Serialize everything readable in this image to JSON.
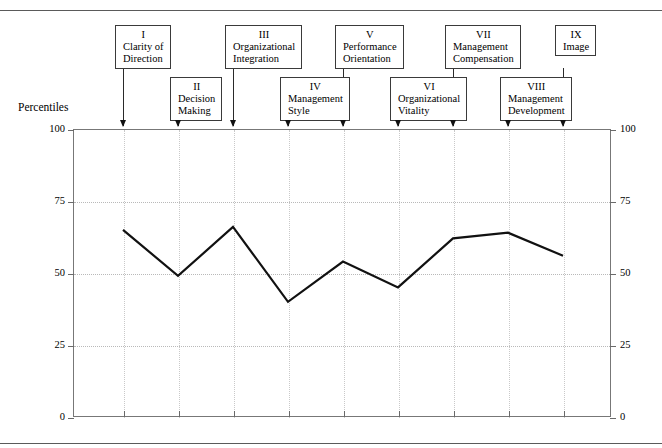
{
  "figure": {
    "axis_title": "Percentiles",
    "rules": [
      "top-rule",
      "bottom-rule"
    ]
  },
  "callouts": [
    {
      "roman": "I",
      "name": "Clarity of\nDirection",
      "position": "top"
    },
    {
      "roman": "II",
      "name": "Decision\nMaking",
      "position": "bottom"
    },
    {
      "roman": "III",
      "name": "Organizational\nIntegration",
      "position": "top"
    },
    {
      "roman": "IV",
      "name": "Management\nStyle",
      "position": "bottom"
    },
    {
      "roman": "V",
      "name": "Performance\nOrientation",
      "position": "top"
    },
    {
      "roman": "VI",
      "name": "Organizational\nVitality",
      "position": "bottom"
    },
    {
      "roman": "VII",
      "name": "Management\nCompensation",
      "position": "top"
    },
    {
      "roman": "VIII",
      "name": "Management\nDevelopment",
      "position": "bottom"
    },
    {
      "roman": "IX",
      "name": "Image",
      "position": "top"
    }
  ],
  "chart_data": {
    "type": "line",
    "title": "",
    "xlabel": "",
    "ylabel": "Percentiles",
    "ylim": [
      0,
      100
    ],
    "yticks": [
      0,
      25,
      50,
      75,
      100
    ],
    "ytick_labels_left": [
      "100",
      "75",
      "50",
      "25",
      "0"
    ],
    "ytick_labels_right": [
      "100",
      "75",
      "50",
      "25",
      "0"
    ],
    "grid": true,
    "legend": "none",
    "categories": [
      "I Clarity of Direction",
      "II Decision Making",
      "III Organizational Integration",
      "IV Management Style",
      "V Performance Orientation",
      "VI Organizational Vitality",
      "VII Management Compensation",
      "VIII Management Development",
      "IX Image"
    ],
    "values": [
      65,
      49,
      66,
      40,
      54,
      45,
      62,
      64,
      56
    ]
  }
}
